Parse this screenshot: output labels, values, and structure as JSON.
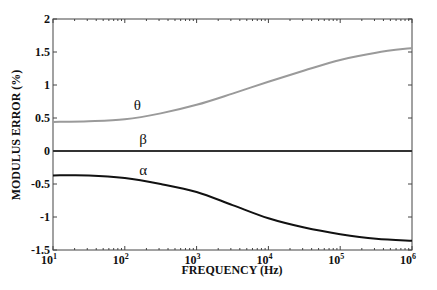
{
  "chart_data": {
    "type": "line",
    "title": "",
    "xlabel": "FREQUENCY (Hz)",
    "ylabel": "MODULUS ERROR (%)",
    "xscale": "log",
    "xlim": [
      10,
      1000000
    ],
    "ylim": [
      -1.5,
      2
    ],
    "grid": false,
    "legend": "none (inline curve labels)",
    "x_tick_labels": [
      {
        "base": "10",
        "exp": "1"
      },
      {
        "base": "10",
        "exp": "2"
      },
      {
        "base": "10",
        "exp": "3"
      },
      {
        "base": "10",
        "exp": "4"
      },
      {
        "base": "10",
        "exp": "5"
      },
      {
        "base": "10",
        "exp": "6"
      }
    ],
    "y_ticks": [
      -1.5,
      -1,
      -0.5,
      0,
      0.5,
      1,
      1.5,
      2
    ],
    "y_tick_labels": [
      "-1.5",
      "-1",
      "-0.5",
      "0",
      "0.5",
      "1",
      "1.5",
      "2"
    ],
    "x": [
      10,
      31.6,
      100,
      316,
      1000,
      3162,
      10000,
      31623,
      100000,
      316228,
      1000000
    ],
    "series": [
      {
        "name": "θ",
        "label": "θ",
        "color": "#9a9a9a",
        "values": [
          0.44,
          0.45,
          0.48,
          0.57,
          0.7,
          0.87,
          1.05,
          1.22,
          1.38,
          1.49,
          1.56
        ]
      },
      {
        "name": "β",
        "label": "β",
        "color": "#333333",
        "values": [
          0,
          0,
          0,
          0,
          0,
          0,
          0,
          0,
          0,
          0,
          0
        ]
      },
      {
        "name": "α",
        "label": "α",
        "color": "#111111",
        "values": [
          -0.37,
          -0.37,
          -0.41,
          -0.5,
          -0.62,
          -0.82,
          -1.02,
          -1.16,
          -1.26,
          -1.33,
          -1.36
        ]
      }
    ],
    "annotations": [
      {
        "text": "θ",
        "x": 150,
        "y": 0.62
      },
      {
        "text": "β",
        "x": 180,
        "y": 0.1
      },
      {
        "text": "α",
        "x": 180,
        "y": -0.36
      }
    ]
  }
}
